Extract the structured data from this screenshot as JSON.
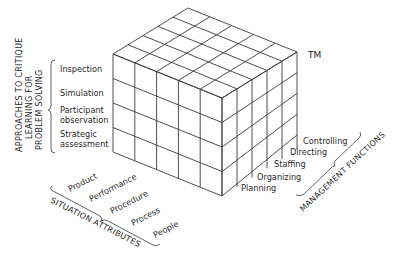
{
  "diagram": {
    "type": "3d-cube-matrix",
    "trademark": "TM",
    "colors": {
      "line": "#3a3a3a",
      "text": "#2a2a2a",
      "background": "#ffffff"
    },
    "vertical_axis": {
      "title_lines": [
        "APPROACHES TO CRITIQUE",
        "LEARNING FOR",
        "PROBLEM SOLVING"
      ],
      "items": [
        {
          "lines": [
            "Inspection"
          ]
        },
        {
          "lines": [
            "Simulation"
          ]
        },
        {
          "lines": [
            "Participant",
            "observation"
          ]
        },
        {
          "lines": [
            "Strategic",
            "assessment"
          ]
        }
      ]
    },
    "left_axis": {
      "title": "SITUATION ATTRIBUTES",
      "items": [
        "Product",
        "Performance",
        "Procedure",
        "Process",
        "People"
      ]
    },
    "right_axis": {
      "title": "MANAGEMENT FUNCTIONS",
      "items": [
        "Planning",
        "Organizing",
        "Staffing",
        "Directing",
        "Controlling"
      ]
    }
  }
}
